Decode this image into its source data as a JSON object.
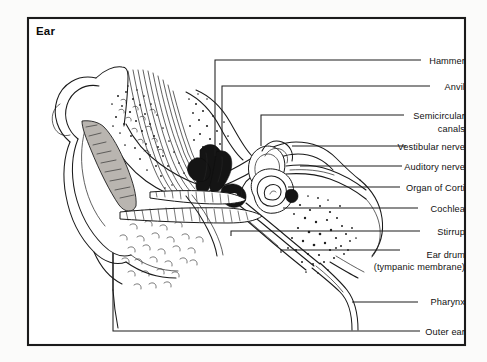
{
  "figure": {
    "title": "Ear",
    "frame": {
      "x": 28,
      "y": 18,
      "width": 437,
      "height": 327
    },
    "background_color": "#ffffff",
    "line_color": "#1a1a1a",
    "labels": [
      {
        "id": "hammer",
        "text": "Hammer",
        "x": 462,
        "y": 62,
        "anchor": "end"
      },
      {
        "id": "anvil",
        "text": "Anvil",
        "x": 462,
        "y": 88,
        "anchor": "end"
      },
      {
        "id": "semicircular",
        "text": "Semicircular",
        "x": 462,
        "y": 117,
        "anchor": "end"
      },
      {
        "id": "canals",
        "text": "canals",
        "x": 462,
        "y": 130,
        "anchor": "end"
      },
      {
        "id": "vestibular-nerve",
        "text": "Vestibular  nerve",
        "x": 462,
        "y": 148,
        "anchor": "end"
      },
      {
        "id": "auditory-nerve",
        "text": "Auditory nerve",
        "x": 462,
        "y": 168,
        "anchor": "end"
      },
      {
        "id": "organ-of-corti",
        "text": "Organ  of Corti",
        "x": 462,
        "y": 189,
        "anchor": "end"
      },
      {
        "id": "cochlea",
        "text": "Cochlea",
        "x": 462,
        "y": 210,
        "anchor": "end"
      },
      {
        "id": "stirrup",
        "text": "Stirrup",
        "x": 462,
        "y": 233,
        "anchor": "end"
      },
      {
        "id": "ear-drum",
        "text": "Ear drum",
        "x": 462,
        "y": 256,
        "anchor": "end"
      },
      {
        "id": "tympanic",
        "text": "(tympanic membrane)",
        "x": 462,
        "y": 268,
        "anchor": "end"
      },
      {
        "id": "pharynx",
        "text": "Pharynx",
        "x": 462,
        "y": 303,
        "anchor": "end"
      },
      {
        "id": "outer-ear",
        "text": "Outer ear",
        "x": 462,
        "y": 333,
        "anchor": "end"
      }
    ],
    "leader_lines": [
      {
        "id": "hammer",
        "path": "M 215 156 L 215 60 L 421 60"
      },
      {
        "id": "anvil",
        "path": "M 222 152 L 222 86 L 430 86"
      },
      {
        "id": "semicircular",
        "path": "M 261 146 L 261 115 L 404 115"
      },
      {
        "id": "vestibular-nerve",
        "path": "M 292 146 L 406 146"
      },
      {
        "id": "auditory-nerve",
        "path": "M 300 166 L 402 166"
      },
      {
        "id": "organ-of-corti",
        "path": "M 288 187 L 400 187"
      },
      {
        "id": "cochlea",
        "path": "M 283 208 L 418 208"
      },
      {
        "id": "stirrup",
        "path": "M 231 236 L 231 231 L 420 231"
      },
      {
        "id": "ear-drum",
        "path": "M 281 253 L 281 250 L 400 250"
      },
      {
        "id": "pharynx",
        "path": "M 352 302 L 418 302"
      },
      {
        "id": "outer-ear",
        "path": "M 113 253 L 113 331 L 420 331"
      }
    ],
    "anatomy_parts": [
      "pinna-outer-ear",
      "ear-canal",
      "ear-drum-tympanic-membrane",
      "hammer-malleus",
      "anvil-incus",
      "stirrup-stapes",
      "semicircular-canals",
      "vestibular-nerve",
      "auditory-nerve",
      "cochlea-spiral",
      "organ-of-corti",
      "eustachian-tube-pharynx",
      "bone-tissue-stipple"
    ]
  }
}
